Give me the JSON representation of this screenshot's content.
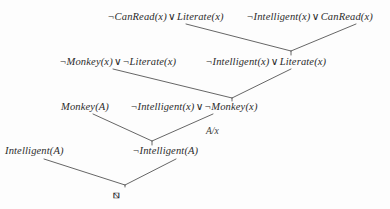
{
  "figure": {
    "type": "resolution-proof-tree",
    "ink_color": "#2b2b2b",
    "background_color": "#fdfdfd"
  },
  "symbols": {
    "negation": "¬",
    "disjunction": "∨",
    "empty_clause": "⧅"
  },
  "clauses": {
    "can_read_literate": {
      "text": "¬CanRead(x) ∨ Literate(x)",
      "neg1": "¬",
      "lit1": "CanRead(x)",
      "op": "∨",
      "lit2": "Literate(x)"
    },
    "intelligent_canread": {
      "text": "¬Intelligent(x) ∨ CanRead(x)",
      "neg1": "¬",
      "lit1": "Intelligent(x)",
      "op": "∨",
      "lit2": "CanRead(x)"
    },
    "monkey_literate": {
      "text": "¬Monkey(x) ∨ ¬Literate(x)",
      "neg1": "¬",
      "lit1": "Monkey(x)",
      "op": "∨",
      "neg2": "¬",
      "lit2": "Literate(x)"
    },
    "intelligent_literate": {
      "text": "¬Intelligent(x) ∨ Literate(x)",
      "neg1": "¬",
      "lit1": "Intelligent(x)",
      "op": "∨",
      "lit2": "Literate(x)"
    },
    "monkey_a": {
      "text": "Monkey(A)",
      "lit1": "Monkey(A)"
    },
    "intelligent_monkey": {
      "text": "¬Intelligent(x) ∨ ¬Monkey(x)",
      "neg1": "¬",
      "lit1": "Intelligent(x)",
      "op": "∨",
      "neg2": "¬",
      "lit2": "Monkey(x)"
    },
    "intelligent_a": {
      "text": "Intelligent(A)",
      "lit1": "Intelligent(A)"
    },
    "not_intelligent_a": {
      "text": "¬Intelligent(A)",
      "neg1": "¬",
      "lit1": "Intelligent(A)"
    }
  },
  "substitution": {
    "label": "A/x"
  },
  "empty_clause": {
    "label": "⧅"
  }
}
